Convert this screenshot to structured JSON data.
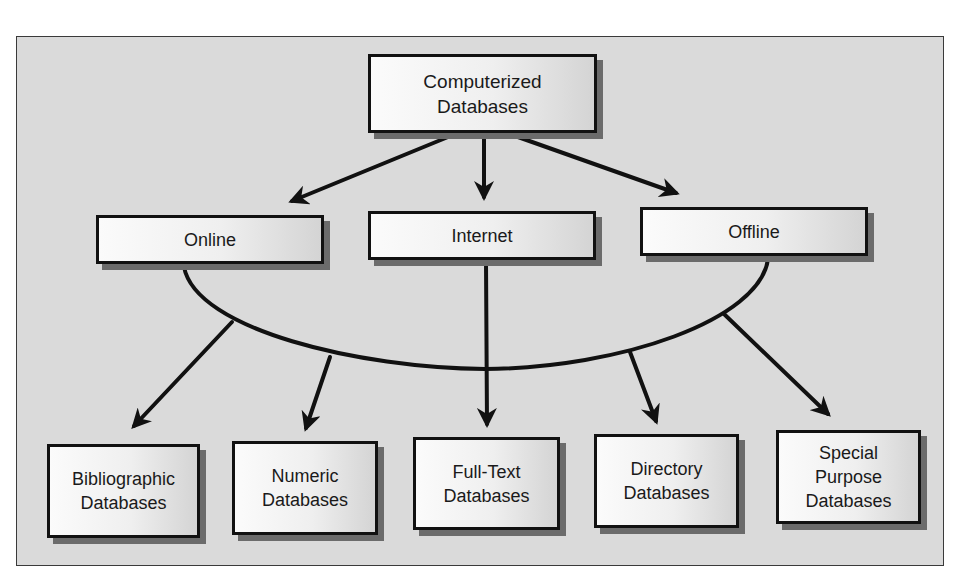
{
  "diagram": {
    "root": {
      "id": "computerized",
      "label": "Computerized\nDatabases"
    },
    "access_methods": [
      {
        "id": "online",
        "label": "Online"
      },
      {
        "id": "internet",
        "label": "Internet"
      },
      {
        "id": "offline",
        "label": "Offline"
      }
    ],
    "database_types": [
      {
        "id": "bibliographic",
        "label": "Bibliographic\nDatabases"
      },
      {
        "id": "numeric",
        "label": "Numeric\nDatabases"
      },
      {
        "id": "fulltext",
        "label": "Full-Text\nDatabases"
      },
      {
        "id": "directory",
        "label": "Directory\nDatabases"
      },
      {
        "id": "special",
        "label": "Special\nPurpose\nDatabases"
      }
    ],
    "edges": [
      {
        "from": "computerized",
        "to": "online"
      },
      {
        "from": "computerized",
        "to": "internet"
      },
      {
        "from": "computerized",
        "to": "offline"
      },
      {
        "from": "access-group",
        "to": "bibliographic"
      },
      {
        "from": "access-group",
        "to": "numeric"
      },
      {
        "from": "access-group",
        "to": "fulltext"
      },
      {
        "from": "access-group",
        "to": "directory"
      },
      {
        "from": "access-group",
        "to": "special"
      }
    ],
    "colors": {
      "background": "#dadada",
      "box_border": "#111111",
      "shadow": "#6b6b6b",
      "line": "#111111"
    }
  }
}
